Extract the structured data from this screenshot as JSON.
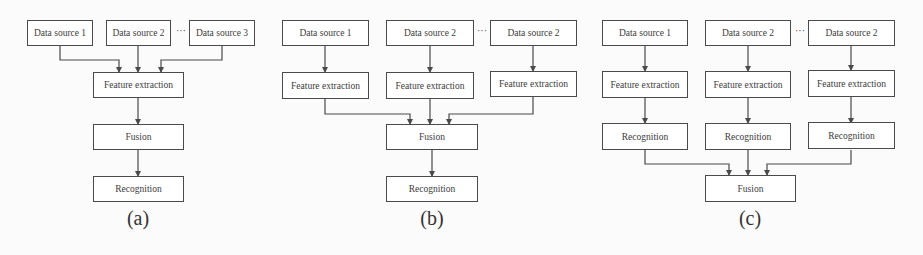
{
  "figure": {
    "panels": [
      {
        "id": "a",
        "caption": "(a)",
        "sources": [
          "Data source 1",
          "Data source 2",
          "Data source 3"
        ],
        "ellipsis": "···",
        "pipeline": [
          "Feature extraction",
          "Fusion",
          "Recognition"
        ]
      },
      {
        "id": "b",
        "caption": "(b)",
        "sources": [
          "Data source 1",
          "Data source 2",
          "Data source 2"
        ],
        "ellipsis": "···",
        "per_source": [
          "Feature extraction",
          "Feature extraction",
          "Feature extraction"
        ],
        "pipeline": [
          "Fusion",
          "Recognition"
        ]
      },
      {
        "id": "c",
        "caption": "(c)",
        "sources": [
          "Data source 1",
          "Data source 2",
          "Data source 2"
        ],
        "ellipsis": "···",
        "per_source_1": [
          "Feature extraction",
          "Feature extraction",
          "Feature extraction"
        ],
        "per_source_2": [
          "Recognition",
          "Recognition",
          "Recognition"
        ],
        "pipeline": [
          "Fusion"
        ]
      }
    ],
    "colors": {
      "line": "#4a4a4a",
      "box_fill": "#ffffff",
      "text": "#3c3c3c"
    }
  }
}
